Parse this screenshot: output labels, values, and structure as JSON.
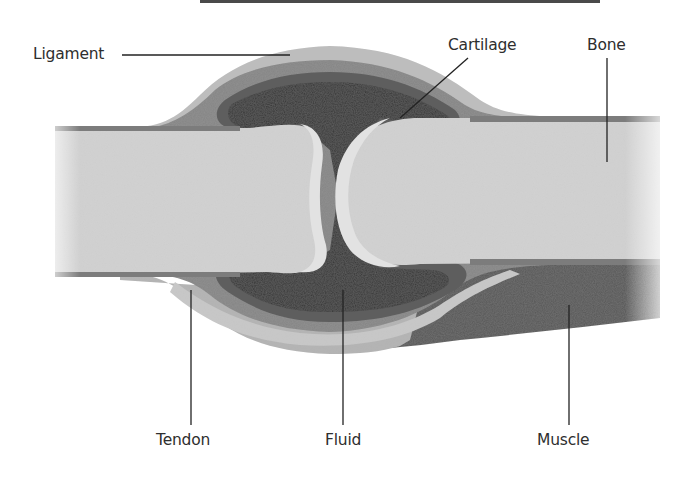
{
  "diagram": {
    "labels": {
      "ligament": "Ligament",
      "cartilage": "Cartilage",
      "bone": "Bone",
      "tendon": "Tendon",
      "fluid": "Fluid",
      "muscle": "Muscle"
    },
    "colors": {
      "background": "#ffffff",
      "bone": "#d2d2d2",
      "cartilage": "#e0e0e0",
      "fluid": "#363636",
      "synovial_membrane": "#5e5e5e",
      "capsule": "#858585",
      "ligament": "#bdbdbd",
      "tendon": "#b3b3b3",
      "muscle": "#575757",
      "leader_line": "#222222",
      "label_text": "#2e2e2e"
    }
  }
}
